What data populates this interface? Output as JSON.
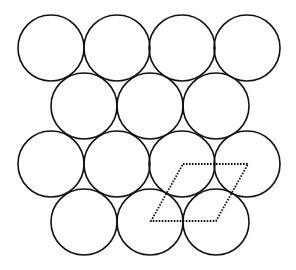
{
  "diagram": {
    "type": "hexagonal-close-packing",
    "radius": 33,
    "stroke_color": "#111111",
    "background": "#ffffff",
    "rows": [
      {
        "y": 48,
        "x": [
          51,
          117,
          182,
          247
        ]
      },
      {
        "y": 106,
        "x": [
          84,
          150,
          216
        ]
      },
      {
        "y": 164,
        "x": [
          51,
          117,
          182,
          247
        ]
      },
      {
        "y": 222,
        "x": [
          84,
          150,
          216
        ]
      }
    ],
    "unit_cell": {
      "style": "dotted",
      "points": [
        [
          183,
          164
        ],
        [
          248,
          164
        ],
        [
          216,
          221
        ],
        [
          151,
          221
        ]
      ]
    }
  }
}
